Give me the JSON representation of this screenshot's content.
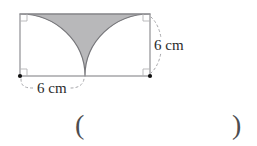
{
  "figure": {
    "type": "geometry-diagram",
    "labels": {
      "right_side_length": "6 cm",
      "bottom_half_length": "6 cm"
    },
    "marks": {
      "right_angle_corners": [
        "top-left",
        "top-right",
        "bottom-left",
        "bottom-right"
      ],
      "center_dots": [
        "bottom-left",
        "bottom-right"
      ]
    }
  },
  "answer_line": {
    "open_paren": "(",
    "close_paren": ")"
  },
  "colors": {
    "background": "#ffffff",
    "shaded_fill": "#b8b8ba",
    "arc_stroke": "#76767a",
    "rect_stroke": "#8f8f93",
    "guide_stroke": "#a7a7ab",
    "angle_mark_stroke": "#b3b3b6",
    "text_color": "#2b2b2b",
    "paren_color": "#4d4d4f",
    "dot_color": "#111111"
  }
}
